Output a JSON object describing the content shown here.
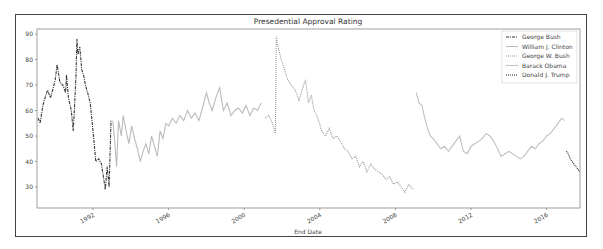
{
  "chart_data": {
    "type": "line",
    "title": "Presedential Approval Rating",
    "xlabel": "End Date",
    "ylabel": "",
    "ylim": [
      22,
      92
    ],
    "xlim": [
      1989.05,
      2017.8
    ],
    "grid": false,
    "legend_position": "upper right",
    "yticks": [
      30,
      40,
      50,
      60,
      70,
      80,
      90
    ],
    "xticks": [
      "1992",
      "1996",
      "2000",
      "2004",
      "2008",
      "2012",
      "2016"
    ],
    "xtick_values": [
      1992,
      1996,
      2000,
      2004,
      2008,
      2012,
      2016
    ],
    "series": [
      {
        "name": "George Bush",
        "style": "dashdot",
        "color": "#333333",
        "x": [
          1989.1,
          1989.2,
          1989.35,
          1989.5,
          1989.6,
          1989.75,
          1989.9,
          1990.0,
          1990.1,
          1990.25,
          1990.4,
          1990.55,
          1990.6,
          1990.7,
          1990.85,
          1990.95,
          1991.0,
          1991.1,
          1991.15,
          1991.2,
          1991.3,
          1991.4,
          1991.5,
          1991.6,
          1991.75,
          1991.85,
          1992.0,
          1992.15,
          1992.3,
          1992.45,
          1992.55,
          1992.65,
          1992.75,
          1992.85,
          1992.95
        ],
        "y": [
          57,
          55,
          62,
          66,
          68,
          65,
          69,
          72,
          78,
          71,
          70,
          67,
          74,
          65,
          60,
          52,
          58,
          74,
          88,
          82,
          85,
          76,
          74,
          70,
          66,
          63,
          52,
          40,
          41,
          39,
          34,
          29,
          38,
          30,
          56
        ]
      },
      {
        "name": "William J. Clinton",
        "style": "solid",
        "color": "#bbbbbb",
        "x": [
          1993.05,
          1993.15,
          1993.25,
          1993.35,
          1993.5,
          1993.6,
          1993.75,
          1993.9,
          1994.05,
          1994.2,
          1994.35,
          1994.5,
          1994.65,
          1994.8,
          1994.95,
          1995.1,
          1995.25,
          1995.4,
          1995.55,
          1995.7,
          1995.85,
          1996.0,
          1996.2,
          1996.4,
          1996.6,
          1996.8,
          1997.0,
          1997.2,
          1997.4,
          1997.6,
          1997.8,
          1998.0,
          1998.15,
          1998.3,
          1998.5,
          1998.7,
          1998.9,
          1999.1,
          1999.3,
          1999.5,
          1999.7,
          1999.9,
          2000.1,
          2000.3,
          2000.5,
          2000.7,
          2000.9
        ],
        "y": [
          56,
          48,
          38,
          56,
          50,
          58,
          52,
          47,
          54,
          49,
          45,
          40,
          44,
          47,
          43,
          50,
          46,
          42,
          52,
          49,
          55,
          54,
          57,
          55,
          58,
          56,
          60,
          57,
          59,
          56,
          61,
          67,
          63,
          60,
          65,
          69,
          60,
          63,
          58,
          60,
          61,
          59,
          62,
          58,
          61,
          60,
          63
        ]
      },
      {
        "name": "George W. Bush",
        "style": "dotted",
        "color": "#999999",
        "x": [
          2001.1,
          2001.3,
          2001.5,
          2001.65,
          2001.7,
          2001.75,
          2001.8,
          2001.95,
          2002.1,
          2002.3,
          2002.5,
          2002.7,
          2002.9,
          2003.1,
          2003.25,
          2003.4,
          2003.55,
          2003.7,
          2003.9,
          2004.1,
          2004.3,
          2004.5,
          2004.7,
          2004.9,
          2005.1,
          2005.3,
          2005.5,
          2005.7,
          2005.9,
          2006.1,
          2006.3,
          2006.5,
          2006.7,
          2006.9,
          2007.1,
          2007.3,
          2007.5,
          2007.7,
          2007.9,
          2008.1,
          2008.3,
          2008.5,
          2008.7,
          2008.95
        ],
        "y": [
          57,
          58,
          55,
          51,
          89,
          86,
          85,
          80,
          77,
          72,
          70,
          68,
          64,
          69,
          72,
          63,
          66,
          60,
          57,
          52,
          50,
          53,
          49,
          50,
          48,
          45,
          44,
          41,
          42,
          38,
          40,
          36,
          39,
          37,
          36,
          35,
          33,
          34,
          31,
          32,
          30,
          28,
          31,
          29
        ]
      },
      {
        "name": "Barack Obama",
        "style": "solid",
        "color": "#c0c0c0",
        "x": [
          2009.1,
          2009.25,
          2009.4,
          2009.55,
          2009.7,
          2009.85,
          2010.0,
          2010.2,
          2010.4,
          2010.6,
          2010.8,
          2011.0,
          2011.2,
          2011.4,
          2011.6,
          2011.8,
          2012.0,
          2012.2,
          2012.4,
          2012.6,
          2012.8,
          2013.0,
          2013.2,
          2013.4,
          2013.6,
          2013.8,
          2014.0,
          2014.2,
          2014.4,
          2014.6,
          2014.8,
          2015.0,
          2015.2,
          2015.4,
          2015.6,
          2015.8,
          2016.0,
          2016.2,
          2016.4,
          2016.6,
          2016.8,
          2016.95
        ],
        "y": [
          67,
          63,
          62,
          57,
          53,
          50,
          49,
          47,
          45,
          46,
          44,
          46,
          48,
          50,
          44,
          43,
          46,
          47,
          48,
          49,
          51,
          50,
          48,
          45,
          42,
          43,
          44,
          43,
          42,
          41,
          42,
          44,
          46,
          45,
          47,
          48,
          50,
          51,
          53,
          55,
          57,
          56
        ]
      },
      {
        "name": "Donald J. Trump",
        "style": "dotted",
        "color": "#222222",
        "x": [
          2017.05,
          2017.15,
          2017.25,
          2017.35,
          2017.45,
          2017.55,
          2017.65,
          2017.75
        ],
        "y": [
          44,
          43,
          41,
          40,
          39,
          38,
          37,
          36
        ]
      }
    ]
  },
  "layout": {
    "plot_left": 37,
    "plot_top": 29,
    "plot_right": 580,
    "plot_bottom": 208,
    "x_origin_year": 1992,
    "x_origin_px": 93,
    "px_per_year": 18.9,
    "y_origin_val": 30,
    "y_origin_px": 187,
    "px_per_unit": 2.55
  }
}
